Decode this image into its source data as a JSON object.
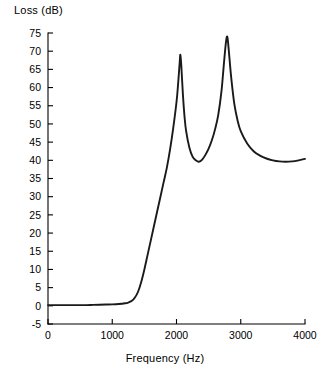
{
  "chart_data": {
    "type": "line",
    "title": "",
    "xlabel": "Frequency (Hz)",
    "ylabel": "Loss (dB)",
    "xlim": [
      0,
      4000
    ],
    "ylim": [
      -5,
      75
    ],
    "xticks": [
      0,
      1000,
      2000,
      3000,
      4000
    ],
    "xtick_labels": [
      "0",
      "1000",
      "2000",
      "3000",
      "4000"
    ],
    "yticks": [
      -5,
      0,
      5,
      10,
      15,
      20,
      25,
      30,
      35,
      40,
      45,
      50,
      55,
      60,
      65,
      70,
      75
    ],
    "ytick_labels": [
      "-5",
      "0",
      "5",
      "10",
      "15",
      "20",
      "25",
      "30",
      "35",
      "40",
      "45",
      "50",
      "55",
      "60",
      "65",
      "70",
      "75"
    ],
    "grid": false,
    "legend": null,
    "legend_position": "none",
    "series": [
      {
        "name": "Transmission loss",
        "color": "#1a1a1a",
        "x": [
          0,
          100,
          200,
          300,
          400,
          500,
          600,
          700,
          800,
          900,
          1000,
          1100,
          1200,
          1250,
          1300,
          1350,
          1400,
          1450,
          1500,
          1550,
          1600,
          1650,
          1700,
          1750,
          1800,
          1850,
          1900,
          1950,
          2000,
          2025,
          2050,
          2060,
          2075,
          2100,
          2125,
          2150,
          2200,
          2250,
          2300,
          2350,
          2400,
          2450,
          2500,
          2550,
          2600,
          2650,
          2700,
          2740,
          2770,
          2790,
          2810,
          2850,
          2900,
          2950,
          3000,
          3100,
          3200,
          3300,
          3400,
          3500,
          3600,
          3700,
          3800,
          3900,
          4000
        ],
        "y": [
          0.2,
          0.2,
          0.2,
          0.2,
          0.2,
          0.2,
          0.2,
          0.25,
          0.3,
          0.35,
          0.4,
          0.5,
          0.7,
          0.9,
          1.3,
          2.2,
          3.8,
          6.5,
          10.0,
          14.0,
          18.0,
          22.0,
          26.0,
          30.0,
          34.0,
          38.0,
          43.0,
          49.0,
          56.0,
          61.0,
          67.0,
          69.0,
          66.0,
          58.0,
          52.0,
          48.0,
          43.5,
          41.0,
          40.0,
          39.6,
          40.2,
          41.5,
          43.2,
          45.5,
          48.5,
          52.5,
          59.0,
          67.0,
          72.5,
          74.0,
          71.0,
          63.0,
          55.5,
          51.0,
          48.0,
          44.6,
          42.5,
          41.3,
          40.5,
          40.0,
          39.7,
          39.6,
          39.7,
          40.0,
          40.4
        ]
      }
    ],
    "annotations": [
      {
        "label": "resonance-peak-1",
        "x": 2060,
        "y": 69
      },
      {
        "label": "resonance-peak-2",
        "x": 2790,
        "y": 74
      },
      {
        "label": "inter-peak-minimum",
        "x": 2350,
        "y": 39.6
      },
      {
        "label": "high-frequency-minimum",
        "x": 3700,
        "y": 39.6
      }
    ]
  }
}
